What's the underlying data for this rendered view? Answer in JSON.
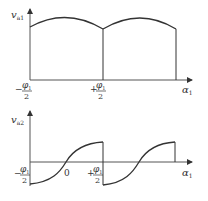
{
  "diagram": {
    "top": {
      "y_axis_label": "v",
      "y_axis_sub": "a1",
      "x_axis_label": "α",
      "x_axis_sub": "1",
      "tick_left_sign": "−",
      "tick_left_num": "φ",
      "tick_left_num_sub": "1",
      "tick_left_den": "2",
      "tick_right_sign": "+",
      "tick_right_num": "φ",
      "tick_right_num_sub": "1",
      "tick_right_den": "2"
    },
    "bottom": {
      "y_axis_label": "v",
      "y_axis_sub": "a2",
      "x_axis_label": "α",
      "x_axis_sub": "1",
      "zero_label": "0",
      "tick_left_sign": "−",
      "tick_left_num": "φ",
      "tick_left_num_sub": "1",
      "tick_left_den": "2",
      "tick_right_sign": "+",
      "tick_right_num": "φ",
      "tick_right_num_sub": "1",
      "tick_right_den": "2"
    },
    "colors": {
      "line": "#333333",
      "axis": "#555555"
    }
  }
}
